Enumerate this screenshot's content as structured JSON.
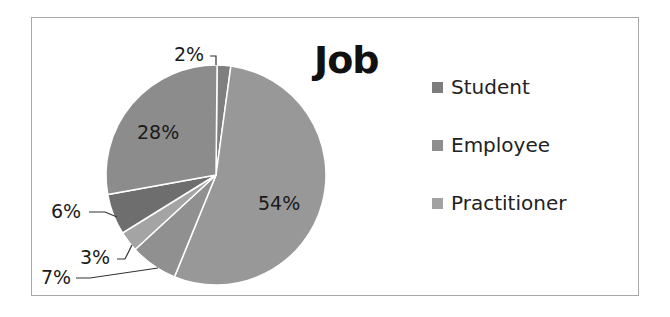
{
  "chart_data": {
    "type": "pie",
    "title": "Job",
    "legend_position": "right",
    "legend": [
      "Student",
      "Employee",
      "Practitioner"
    ],
    "slices": [
      {
        "label": "2%",
        "value": 2,
        "color": "#7f7f7f"
      },
      {
        "label": "54%",
        "value": 54,
        "color": "#989898"
      },
      {
        "label": "7%",
        "value": 7,
        "color": "#909090"
      },
      {
        "label": "3%",
        "value": 3,
        "color": "#a4a4a4"
      },
      {
        "label": "6%",
        "value": 6,
        "color": "#6e6e6e"
      },
      {
        "label": "28%",
        "value": 28,
        "color": "#8c8c8c"
      }
    ],
    "legend_colors": [
      "#7d7d7d",
      "#8e8e8e",
      "#a2a2a2"
    ]
  },
  "title": "Job",
  "legend": [
    {
      "label": "Student",
      "color": "#7d7d7d"
    },
    {
      "label": "Employee",
      "color": "#8e8e8e"
    },
    {
      "label": "Practitioner",
      "color": "#a2a2a2"
    }
  ],
  "labels": {
    "l2": "2%",
    "l54": "54%",
    "l7": "7%",
    "l3": "3%",
    "l6": "6%",
    "l28": "28%"
  }
}
